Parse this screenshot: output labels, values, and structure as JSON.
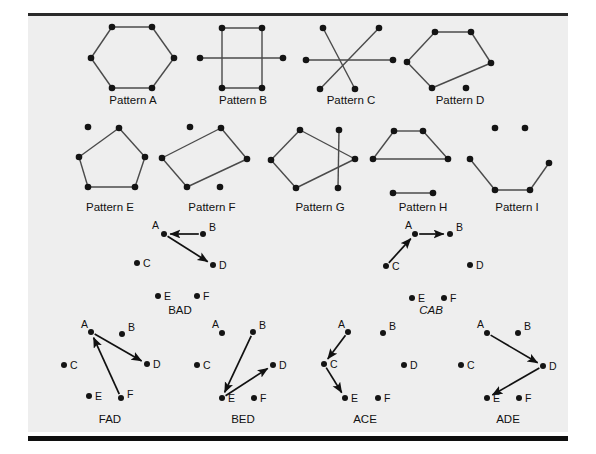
{
  "figure": {
    "background_color": "#eeeeee",
    "page_color": "#ffffff",
    "node_color": "#141414",
    "edge_color": "#4a4a4a",
    "arrow_color": "#111111",
    "rule_color": "#101010"
  },
  "patterns": [
    {
      "id": "pattern-a",
      "label": "Pattern A",
      "label_x": 133,
      "label_y": 104,
      "shape": "hexagon",
      "nodes": [
        {
          "x": 112,
          "y": 27
        },
        {
          "x": 152,
          "y": 27
        },
        {
          "x": 174,
          "y": 58
        },
        {
          "x": 152,
          "y": 88
        },
        {
          "x": 112,
          "y": 88
        },
        {
          "x": 91,
          "y": 58
        }
      ],
      "edges": [
        [
          0,
          1
        ],
        [
          1,
          2
        ],
        [
          2,
          3
        ],
        [
          3,
          4
        ],
        [
          4,
          5
        ],
        [
          5,
          0
        ]
      ]
    },
    {
      "id": "pattern-b",
      "label": "Pattern B",
      "label_x": 243,
      "label_y": 104,
      "shape": "rectangle-with-crossbar",
      "nodes": [
        {
          "x": 222,
          "y": 28
        },
        {
          "x": 262,
          "y": 28
        },
        {
          "x": 262,
          "y": 88
        },
        {
          "x": 222,
          "y": 88
        },
        {
          "x": 200,
          "y": 58
        },
        {
          "x": 283,
          "y": 58
        }
      ],
      "edges": [
        [
          0,
          1
        ],
        [
          1,
          2
        ],
        [
          2,
          3
        ],
        [
          3,
          0
        ],
        [
          4,
          5
        ]
      ]
    },
    {
      "id": "pattern-c",
      "label": "Pattern C",
      "label_x": 351,
      "label_y": 104,
      "shape": "asterisk",
      "nodes": [
        {
          "x": 323,
          "y": 28
        },
        {
          "x": 379,
          "y": 28
        },
        {
          "x": 393,
          "y": 60
        },
        {
          "x": 355,
          "y": 89
        },
        {
          "x": 320,
          "y": 89
        },
        {
          "x": 306,
          "y": 60
        }
      ],
      "edges": [
        [
          0,
          3
        ],
        [
          1,
          4
        ],
        [
          2,
          5
        ]
      ]
    },
    {
      "id": "pattern-d",
      "label": "Pattern D",
      "label_x": 460,
      "label_y": 104,
      "shape": "pentagon-plus-dot",
      "nodes": [
        {
          "x": 435,
          "y": 32
        },
        {
          "x": 471,
          "y": 32
        },
        {
          "x": 491,
          "y": 63
        },
        {
          "x": 432,
          "y": 88
        },
        {
          "x": 407,
          "y": 62
        },
        {
          "x": 466,
          "y": 88
        }
      ],
      "edges": [
        [
          0,
          1
        ],
        [
          1,
          2
        ],
        [
          2,
          3
        ],
        [
          3,
          4
        ],
        [
          4,
          0
        ]
      ]
    },
    {
      "id": "pattern-e",
      "label": "Pattern E",
      "label_x": 110,
      "label_y": 211,
      "shape": "pentagon-plus-dot",
      "nodes": [
        {
          "x": 119,
          "y": 128
        },
        {
          "x": 145,
          "y": 157
        },
        {
          "x": 135,
          "y": 187
        },
        {
          "x": 88,
          "y": 187
        },
        {
          "x": 79,
          "y": 157
        },
        {
          "x": 88,
          "y": 127
        }
      ],
      "edges": [
        [
          0,
          1
        ],
        [
          1,
          2
        ],
        [
          2,
          3
        ],
        [
          3,
          4
        ],
        [
          4,
          0
        ]
      ]
    },
    {
      "id": "pattern-f",
      "label": "Pattern F",
      "label_x": 212,
      "label_y": 211,
      "shape": "quadrilateral-plus-two-dots",
      "nodes": [
        {
          "x": 221,
          "y": 128
        },
        {
          "x": 247,
          "y": 159
        },
        {
          "x": 187,
          "y": 187
        },
        {
          "x": 162,
          "y": 158
        },
        {
          "x": 190,
          "y": 127
        },
        {
          "x": 220,
          "y": 187
        }
      ],
      "edges": [
        [
          0,
          1
        ],
        [
          1,
          2
        ],
        [
          2,
          3
        ],
        [
          3,
          0
        ]
      ]
    },
    {
      "id": "pattern-g",
      "label": "Pattern G",
      "label_x": 320,
      "label_y": 211,
      "shape": "quad-with-crossing",
      "nodes": [
        {
          "x": 300,
          "y": 130
        },
        {
          "x": 339,
          "y": 130
        },
        {
          "x": 355,
          "y": 159
        },
        {
          "x": 296,
          "y": 188
        },
        {
          "x": 271,
          "y": 160
        },
        {
          "x": 338,
          "y": 188
        }
      ],
      "edges": [
        [
          0,
          4
        ],
        [
          4,
          3
        ],
        [
          3,
          2
        ],
        [
          2,
          0
        ],
        [
          1,
          5
        ]
      ]
    },
    {
      "id": "pattern-h",
      "label": "Pattern H",
      "label_x": 423,
      "label_y": 211,
      "shape": "trapezoid-plus-segment",
      "nodes": [
        {
          "x": 394,
          "y": 131
        },
        {
          "x": 423,
          "y": 131
        },
        {
          "x": 448,
          "y": 159
        },
        {
          "x": 373,
          "y": 159
        },
        {
          "x": 393,
          "y": 193
        },
        {
          "x": 433,
          "y": 193
        }
      ],
      "edges": [
        [
          0,
          1
        ],
        [
          1,
          2
        ],
        [
          2,
          3
        ],
        [
          3,
          0
        ],
        [
          4,
          5
        ]
      ]
    },
    {
      "id": "pattern-i",
      "label": "Pattern I",
      "label_x": 517,
      "label_y": 211,
      "shape": "zigzag-plus-two-dots",
      "nodes": [
        {
          "x": 470,
          "y": 159
        },
        {
          "x": 495,
          "y": 190
        },
        {
          "x": 530,
          "y": 190
        },
        {
          "x": 549,
          "y": 163
        },
        {
          "x": 495,
          "y": 128
        },
        {
          "x": 525,
          "y": 128
        }
      ],
      "edges": [
        [
          0,
          1
        ],
        [
          1,
          2
        ],
        [
          2,
          3
        ]
      ]
    }
  ],
  "arrow_diagrams": [
    {
      "id": "diagram-bad",
      "caption": "BAD",
      "caption_x": 180,
      "caption_y": 314,
      "italic": false,
      "points": {
        "A": {
          "x": 164,
          "y": 234,
          "lx": 159,
          "ly": 229,
          "anchor": "end"
        },
        "B": {
          "x": 203,
          "y": 234,
          "lx": 209,
          "ly": 231,
          "anchor": "start"
        },
        "C": {
          "x": 137,
          "y": 263,
          "lx": 143,
          "ly": 267,
          "anchor": "start"
        },
        "D": {
          "x": 213,
          "y": 265,
          "lx": 219,
          "ly": 269,
          "anchor": "start"
        },
        "E": {
          "x": 158,
          "y": 296,
          "lx": 164,
          "ly": 300,
          "anchor": "start"
        },
        "F": {
          "x": 197,
          "y": 296,
          "lx": 203,
          "ly": 300,
          "anchor": "start"
        }
      },
      "arrows": [
        [
          "B",
          "A"
        ],
        [
          "A",
          "D"
        ]
      ]
    },
    {
      "id": "diagram-cab",
      "caption": "CAB",
      "caption_x": 431,
      "caption_y": 314,
      "italic": true,
      "points": {
        "A": {
          "x": 415,
          "y": 234,
          "lx": 412,
          "ly": 229,
          "anchor": "end"
        },
        "B": {
          "x": 450,
          "y": 234,
          "lx": 456,
          "ly": 231,
          "anchor": "start"
        },
        "C": {
          "x": 386,
          "y": 266,
          "lx": 392,
          "ly": 270,
          "anchor": "start"
        },
        "D": {
          "x": 470,
          "y": 265,
          "lx": 476,
          "ly": 269,
          "anchor": "start"
        },
        "E": {
          "x": 412,
          "y": 298,
          "lx": 418,
          "ly": 302,
          "anchor": "start"
        },
        "F": {
          "x": 444,
          "y": 298,
          "lx": 450,
          "ly": 302,
          "anchor": "start"
        }
      },
      "arrows": [
        [
          "C",
          "A"
        ],
        [
          "A",
          "B"
        ]
      ]
    },
    {
      "id": "diagram-fad",
      "caption": "FAD",
      "caption_x": 110,
      "caption_y": 423,
      "italic": false,
      "points": {
        "A": {
          "x": 91,
          "y": 332,
          "lx": 88,
          "ly": 328,
          "anchor": "end"
        },
        "B": {
          "x": 122,
          "y": 334,
          "lx": 128,
          "ly": 331,
          "anchor": "start"
        },
        "C": {
          "x": 64,
          "y": 365,
          "lx": 70,
          "ly": 369,
          "anchor": "start"
        },
        "D": {
          "x": 147,
          "y": 364,
          "lx": 153,
          "ly": 368,
          "anchor": "start"
        },
        "E": {
          "x": 89,
          "y": 396,
          "lx": 95,
          "ly": 400,
          "anchor": "start"
        },
        "F": {
          "x": 121,
          "y": 398,
          "lx": 127,
          "ly": 398,
          "anchor": "start"
        }
      },
      "arrows": [
        [
          "F",
          "A"
        ],
        [
          "A",
          "D"
        ]
      ]
    },
    {
      "id": "diagram-bed",
      "caption": "BED",
      "caption_x": 243,
      "caption_y": 423,
      "italic": false,
      "points": {
        "A": {
          "x": 222,
          "y": 333,
          "lx": 219,
          "ly": 328,
          "anchor": "end"
        },
        "B": {
          "x": 253,
          "y": 332,
          "lx": 259,
          "ly": 329,
          "anchor": "start"
        },
        "C": {
          "x": 197,
          "y": 365,
          "lx": 203,
          "ly": 369,
          "anchor": "start"
        },
        "D": {
          "x": 273,
          "y": 365,
          "lx": 279,
          "ly": 369,
          "anchor": "start"
        },
        "E": {
          "x": 222,
          "y": 398,
          "lx": 228,
          "ly": 402,
          "anchor": "start"
        },
        "F": {
          "x": 254,
          "y": 398,
          "lx": 260,
          "ly": 402,
          "anchor": "start"
        }
      },
      "arrows": [
        [
          "B",
          "E"
        ],
        [
          "E",
          "D"
        ]
      ]
    },
    {
      "id": "diagram-ace",
      "caption": "ACE",
      "caption_x": 365,
      "caption_y": 423,
      "italic": false,
      "points": {
        "A": {
          "x": 348,
          "y": 332,
          "lx": 345,
          "ly": 328,
          "anchor": "end"
        },
        "B": {
          "x": 383,
          "y": 333,
          "lx": 389,
          "ly": 330,
          "anchor": "start"
        },
        "C": {
          "x": 324,
          "y": 364,
          "lx": 330,
          "ly": 368,
          "anchor": "start"
        },
        "D": {
          "x": 404,
          "y": 365,
          "lx": 410,
          "ly": 369,
          "anchor": "start"
        },
        "E": {
          "x": 345,
          "y": 398,
          "lx": 351,
          "ly": 402,
          "anchor": "start"
        },
        "F": {
          "x": 378,
          "y": 398,
          "lx": 384,
          "ly": 402,
          "anchor": "start"
        }
      },
      "arrows": [
        [
          "A",
          "C"
        ],
        [
          "C",
          "E"
        ]
      ]
    },
    {
      "id": "diagram-ade",
      "caption": "ADE",
      "caption_x": 508,
      "caption_y": 423,
      "italic": false,
      "points": {
        "A": {
          "x": 487,
          "y": 333,
          "lx": 484,
          "ly": 328,
          "anchor": "end"
        },
        "B": {
          "x": 518,
          "y": 333,
          "lx": 524,
          "ly": 330,
          "anchor": "start"
        },
        "C": {
          "x": 461,
          "y": 365,
          "lx": 467,
          "ly": 369,
          "anchor": "start"
        },
        "D": {
          "x": 543,
          "y": 366,
          "lx": 549,
          "ly": 370,
          "anchor": "start"
        },
        "E": {
          "x": 487,
          "y": 398,
          "lx": 493,
          "ly": 402,
          "anchor": "start"
        },
        "F": {
          "x": 519,
          "y": 398,
          "lx": 525,
          "ly": 402,
          "anchor": "start"
        }
      },
      "arrows": [
        [
          "A",
          "D"
        ],
        [
          "D",
          "E"
        ]
      ]
    }
  ]
}
